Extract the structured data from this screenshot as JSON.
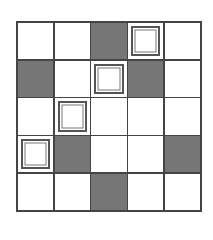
{
  "grid": {
    "rows": 5,
    "cols": 5,
    "colors": {
      "dark": "#767676",
      "light": "#ffffff",
      "line": "#444444"
    },
    "cells": [
      [
        "empty",
        "empty",
        "dark",
        "square",
        "empty"
      ],
      [
        "dark",
        "empty",
        "square",
        "dark",
        "empty"
      ],
      [
        "empty",
        "square",
        "empty",
        "empty",
        "empty"
      ],
      [
        "square",
        "dark",
        "empty",
        "empty",
        "dark"
      ],
      [
        "empty",
        "empty",
        "dark",
        "empty",
        "empty"
      ]
    ]
  }
}
